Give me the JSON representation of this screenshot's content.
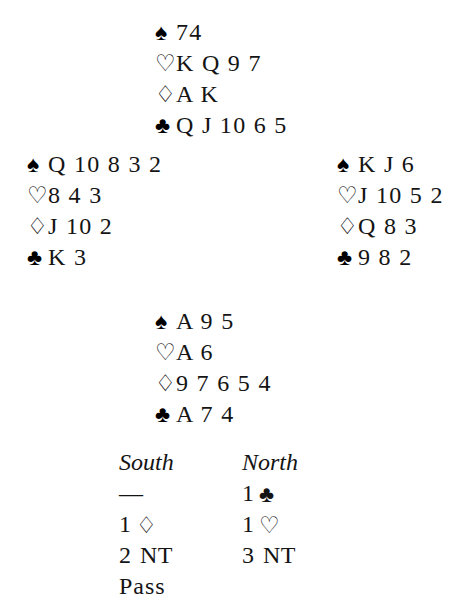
{
  "deal": {
    "north": {
      "label": "North",
      "suits": [
        {
          "suit": "spades",
          "symbol": "♠",
          "color": "black",
          "cards": "74"
        },
        {
          "suit": "hearts",
          "symbol": "♡",
          "color": "white",
          "cards": "K Q 9 7"
        },
        {
          "suit": "diamonds",
          "symbol": "♢",
          "color": "white",
          "cards": "A K"
        },
        {
          "suit": "clubs",
          "symbol": "♣",
          "color": "black",
          "cards": "Q J 10 6 5"
        }
      ]
    },
    "west": {
      "label": "West",
      "suits": [
        {
          "suit": "spades",
          "symbol": "♠",
          "color": "black",
          "cards": "Q 10 8 3 2"
        },
        {
          "suit": "hearts",
          "symbol": "♡",
          "color": "white",
          "cards": "8 4 3"
        },
        {
          "suit": "diamonds",
          "symbol": "♢",
          "color": "white",
          "cards": "J 10 2"
        },
        {
          "suit": "clubs",
          "symbol": "♣",
          "color": "black",
          "cards": "K 3"
        }
      ]
    },
    "east": {
      "label": "East",
      "suits": [
        {
          "suit": "spades",
          "symbol": "♠",
          "color": "black",
          "cards": "K J 6"
        },
        {
          "suit": "hearts",
          "symbol": "♡",
          "color": "white",
          "cards": "J 10 5 2"
        },
        {
          "suit": "diamonds",
          "symbol": "♢",
          "color": "white",
          "cards": "Q 8 3"
        },
        {
          "suit": "clubs",
          "symbol": "♣",
          "color": "black",
          "cards": "9 8 2"
        }
      ]
    },
    "south": {
      "label": "South",
      "suits": [
        {
          "suit": "spades",
          "symbol": "♠",
          "color": "black",
          "cards": "A 9 5"
        },
        {
          "suit": "hearts",
          "symbol": "♡",
          "color": "white",
          "cards": "A 6"
        },
        {
          "suit": "diamonds",
          "symbol": "♢",
          "color": "white",
          "cards": "9 7 6 5 4"
        },
        {
          "suit": "clubs",
          "symbol": "♣",
          "color": "black",
          "cards": "A 7 4"
        }
      ]
    }
  },
  "auction": {
    "headers": {
      "south": "South",
      "north": "North"
    },
    "rows": [
      {
        "south": {
          "level": "—",
          "pip": "",
          "nt": ""
        },
        "north": {
          "level": "1",
          "pip": "♣",
          "nt": ""
        }
      },
      {
        "south": {
          "level": "1",
          "pip": "♢",
          "nt": ""
        },
        "north": {
          "level": "1",
          "pip": "♡",
          "nt": ""
        }
      },
      {
        "south": {
          "level": "2",
          "pip": "",
          "nt": "NT"
        },
        "north": {
          "level": "3",
          "pip": "",
          "nt": "NT"
        }
      },
      {
        "south": {
          "level": "Pass",
          "pip": "",
          "nt": ""
        },
        "north": {
          "level": "",
          "pip": "",
          "nt": ""
        }
      }
    ]
  }
}
